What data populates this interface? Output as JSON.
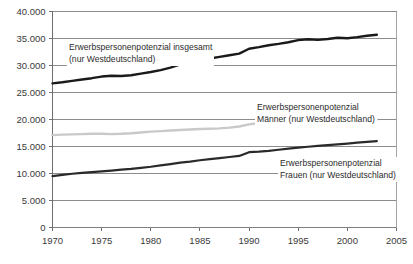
{
  "chart_data": {
    "type": "line",
    "title": "",
    "xlabel": "",
    "ylabel": "",
    "xlim": [
      1970,
      2005
    ],
    "ylim": [
      0,
      40000
    ],
    "grid": true,
    "legend_position": "inline-annotations",
    "xticks": [
      "1970",
      "1975",
      "1980",
      "1985",
      "1990",
      "1995",
      "2000",
      "2005"
    ],
    "xtick_values": [
      1970,
      1975,
      1980,
      1985,
      1990,
      1995,
      2000,
      2005
    ],
    "yticks": [
      "0",
      "5.000",
      "10.000",
      "15.000",
      "20.000",
      "25.000",
      "30.000",
      "35.000",
      "40.000"
    ],
    "ytick_values": [
      0,
      5000,
      10000,
      15000,
      20000,
      25000,
      30000,
      35000,
      40000
    ],
    "x": [
      1970,
      1971,
      1972,
      1973,
      1974,
      1975,
      1976,
      1977,
      1978,
      1979,
      1980,
      1981,
      1982,
      1983,
      1984,
      1985,
      1986,
      1987,
      1988,
      1989,
      1990,
      1991,
      1992,
      1993,
      1994,
      1995,
      1996,
      1997,
      1998,
      1999,
      2000,
      2001,
      2002,
      2003
    ],
    "series": [
      {
        "name": "Erwerbspersonenpotenzial insgesamt (nur Westdeutschland)",
        "color": "#1a1a1a",
        "width": 2.4,
        "values": [
          26700,
          26900,
          27150,
          27400,
          27650,
          27950,
          28100,
          28050,
          28200,
          28500,
          28800,
          29150,
          29600,
          30200,
          30600,
          31000,
          31300,
          31600,
          31900,
          32200,
          33100,
          33400,
          33750,
          34000,
          34300,
          34700,
          34850,
          34750,
          34900,
          35150,
          35050,
          35250,
          35500,
          35700
        ]
      },
      {
        "name": "Erwerbspersonenpotenzial Männer (nur Westdeutschland)",
        "color": "#c9c9c9",
        "width": 2.4,
        "values": [
          17100,
          17200,
          17250,
          17300,
          17350,
          17350,
          17300,
          17350,
          17450,
          17600,
          17750,
          17850,
          17950,
          18050,
          18150,
          18250,
          18300,
          18350,
          18500,
          18700,
          19100,
          19350,
          19600,
          19800,
          19900,
          19950,
          20000,
          20000,
          20000,
          20000,
          20000,
          20000,
          20000,
          20000
        ]
      },
      {
        "name": "Erwerbspersonenpotenzial Frauen (nur Westdeutschland)",
        "color": "#2a2a2a",
        "width": 2.2,
        "values": [
          9500,
          9750,
          9950,
          10100,
          10250,
          10400,
          10550,
          10700,
          10850,
          11050,
          11250,
          11500,
          11750,
          12000,
          12200,
          12450,
          12650,
          12850,
          13050,
          13250,
          13950,
          14050,
          14200,
          14400,
          14600,
          14800,
          14950,
          15100,
          15250,
          15400,
          15550,
          15700,
          15850,
          16000
        ]
      }
    ],
    "annotations": [
      {
        "id": "annot-total",
        "lines": [
          "Erwerbspersonenpotenzial insgesamt",
          "(nur Westdeutschland)"
        ],
        "left": 67,
        "top": 41
      },
      {
        "id": "annot-maenner",
        "lines": [
          "Erwerbspersonenpotenzial",
          "Männer (nur Westdeutschland)"
        ],
        "left": 255,
        "top": 101
      },
      {
        "id": "annot-frauen",
        "lines": [
          "Erwerbspersonenpotenzial",
          "Frauen (nur Westdeutschland)"
        ],
        "left": 278,
        "top": 157
      }
    ],
    "colors": {
      "axis": "#6e6e6e",
      "grid": "#808080",
      "plot_border": "#9a9a9a",
      "background": "#ffffff",
      "tick_text": "#3a3a3a"
    }
  }
}
